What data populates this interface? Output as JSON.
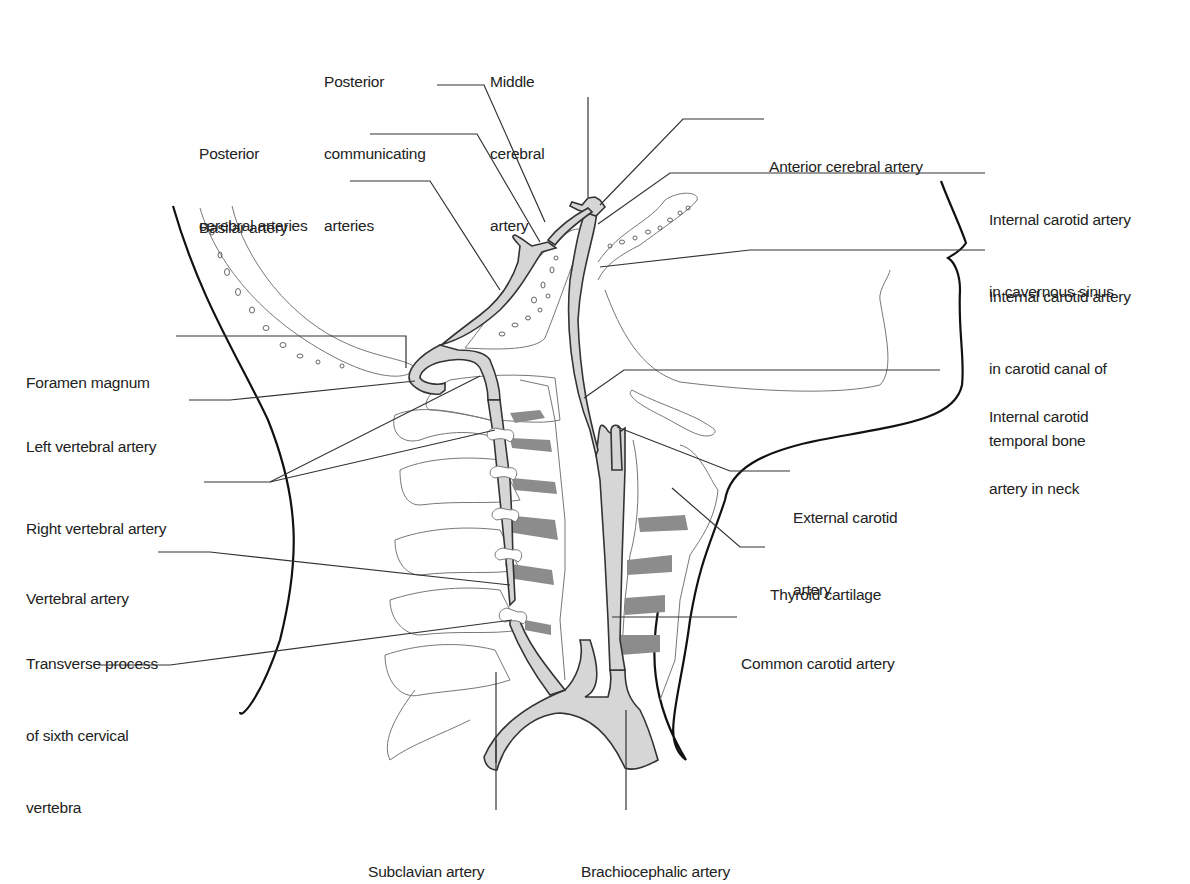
{
  "figure": {
    "colors": {
      "artery_fill": "#d6d6d6",
      "artery_outline": "#333333",
      "disc_fill": "#8c8c8c",
      "skin_outline": "#111111",
      "bone_outline": "#777777",
      "label_text": "#222222",
      "background": "#ffffff"
    }
  },
  "labels": {
    "posterior_communicating": {
      "lines": [
        "Posterior",
        "communicating",
        "arteries"
      ]
    },
    "middle_cerebral": {
      "lines": [
        "Middle",
        "cerebral",
        "artery"
      ]
    },
    "posterior_cerebral": {
      "lines": [
        "Posterior",
        "cerebral arteries"
      ]
    },
    "anterior_cerebral": {
      "lines": [
        "Anterior cerebral artery"
      ]
    },
    "basilar": {
      "lines": [
        "Basilar artery"
      ]
    },
    "ica_cavernous": {
      "lines": [
        "Internal carotid artery",
        "in cavernous sinus"
      ]
    },
    "ica_carotid_canal": {
      "lines": [
        "Internal carotid artery",
        "in carotid canal of",
        "temporal bone"
      ]
    },
    "foramen_magnum": {
      "lines": [
        "Foramen magnum"
      ]
    },
    "ica_neck": {
      "lines": [
        "Internal carotid",
        "artery in neck"
      ]
    },
    "left_vertebral": {
      "lines": [
        "Left vertebral artery"
      ]
    },
    "right_vertebral": {
      "lines": [
        "Right vertebral artery"
      ]
    },
    "external_carotid": {
      "lines": [
        "External carotid",
        "artery"
      ]
    },
    "thyroid_cartilage": {
      "lines": [
        "Thyroid cartilage"
      ]
    },
    "vertebral": {
      "lines": [
        "Vertebral artery"
      ]
    },
    "transverse_process": {
      "lines": [
        "Transverse process",
        "of sixth cervical",
        "vertebra"
      ]
    },
    "common_carotid": {
      "lines": [
        "Common carotid artery"
      ]
    },
    "subclavian": {
      "lines": [
        "Subclavian artery"
      ]
    },
    "brachiocephalic": {
      "lines": [
        "Brachiocephalic artery"
      ]
    }
  }
}
